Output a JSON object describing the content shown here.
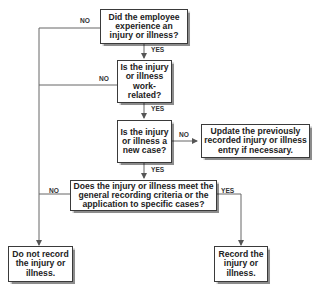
{
  "nodes": {
    "q1": "Did the employee experience an injury or illness?",
    "q2": "Is the injury or illness work-related?",
    "q3": "Is the injury or illness a new case?",
    "update": "Update the previously recorded injury or illness entry if necessary.",
    "q4": "Does the injury or illness meet the general recording criteria or the application to specific cases?",
    "no_record": "Do not record the injury or illness.",
    "record": "Record the injury or illness."
  },
  "labels": {
    "q1_no": "NO",
    "q1_yes": "YES",
    "q2_no": "NO",
    "q2_yes": "YES",
    "q3_no": "NO",
    "q3_yes": "YES",
    "q4_no": "NO",
    "q4_yes": "YES"
  },
  "colors": {
    "line": "#555555",
    "border": "#3a3a3a"
  }
}
